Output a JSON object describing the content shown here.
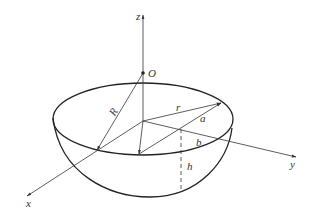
{
  "figure": {
    "type": "hemispherical bowl geometry diagram",
    "axes": {
      "z_label": "z",
      "x_label": "x",
      "y_label": "y"
    },
    "points": {
      "center_label": "O"
    },
    "dimensions": {
      "sphere_radius_label": "R",
      "rim_radius_label": "r",
      "a_label": "a",
      "b_label": "b",
      "h_label": "h"
    },
    "colors": {
      "line": "#333333",
      "background": "#ffffff"
    }
  }
}
